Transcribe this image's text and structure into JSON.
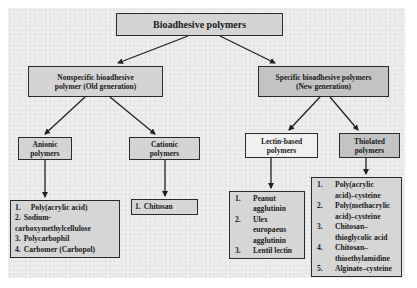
{
  "diagram": {
    "title": "Bioadhesive polymers",
    "colors": {
      "panel_bg": "#ebebeb",
      "box_fill": "#d4d4d4",
      "box_fill_dark": "#c3c3c3",
      "box_fill_light": "#f0f0f0",
      "border": "#2a2a2a"
    },
    "nodes": {
      "root": {
        "label": "Bioadhesive polymers"
      },
      "nonspecific": {
        "line1": "Nonspecific bioadhesive",
        "line2": "polymer (Old generation)"
      },
      "specific": {
        "line1": "Specific bioadhesive polymers",
        "line2": "(New generation)"
      },
      "anionic": {
        "line1": "Anionic",
        "line2": "polymers"
      },
      "cationic": {
        "line1": "Cationic",
        "line2": "polymers"
      },
      "lectin": {
        "line1": "Lectin-based",
        "line2": "polymers"
      },
      "thiolated": {
        "line1": "Thiolated",
        "line2": "polymers"
      }
    },
    "lists": {
      "anionic": [
        {
          "num": "1.",
          "text": "Poly(acrylic acid)"
        },
        {
          "num": "2.",
          "text": "Sodium-"
        },
        {
          "num": "",
          "text": "carboxymethylcellulose"
        },
        {
          "num": "3.",
          "text": "Polycarbophil"
        },
        {
          "num": "4.",
          "text": "Carbomer (Carbopol)"
        }
      ],
      "cationic": [
        {
          "num": "1.",
          "text": "Chitosan"
        }
      ],
      "lectin": [
        {
          "num": "1.",
          "text": "Peanut"
        },
        {
          "num": "",
          "text": "agglutinin"
        },
        {
          "num": "2.",
          "text": "Ulex"
        },
        {
          "num": "",
          "text": "europaeus"
        },
        {
          "num": "",
          "text": "agglutinin"
        },
        {
          "num": "3.",
          "text": "Lentil lectin"
        }
      ],
      "thiolated": [
        {
          "num": "1.",
          "text": "Poly(acrylic"
        },
        {
          "num": "",
          "text": "acid)–cysteine"
        },
        {
          "num": "2.",
          "text": "Poly(methacrylic"
        },
        {
          "num": "",
          "text": "acid)–cysteine"
        },
        {
          "num": "3.",
          "text": "Chitosan–"
        },
        {
          "num": "",
          "text": "thioglycolic acid"
        },
        {
          "num": "4.",
          "text": "Chitosan–"
        },
        {
          "num": "",
          "text": "thioethylamidine"
        },
        {
          "num": "5.",
          "text": "Alginate–cysteine"
        }
      ]
    },
    "edges": [
      {
        "from": "root",
        "to": "nonspecific"
      },
      {
        "from": "root",
        "to": "specific"
      },
      {
        "from": "nonspecific",
        "to": "anionic"
      },
      {
        "from": "nonspecific",
        "to": "cationic"
      },
      {
        "from": "specific",
        "to": "lectin"
      },
      {
        "from": "specific",
        "to": "thiolated"
      },
      {
        "from": "anionic",
        "to": "anionic-list"
      },
      {
        "from": "cationic",
        "to": "cationic-list"
      },
      {
        "from": "lectin",
        "to": "lectin-list"
      },
      {
        "from": "thiolated",
        "to": "thiolated-list"
      }
    ]
  }
}
